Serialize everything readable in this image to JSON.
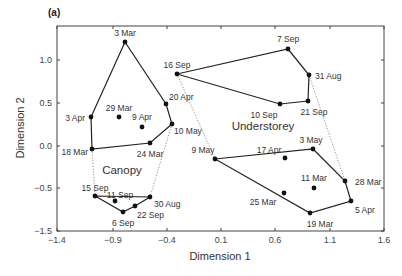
{
  "panel_label": "(a)",
  "chart_data": {
    "type": "scatter",
    "title": "",
    "panel_label": "(a)",
    "xlabel": "Dimension 1",
    "ylabel": "Dimension 2",
    "xlim": [
      -1.4,
      1.6
    ],
    "ylim": [
      -1.5,
      1.35
    ],
    "xticks": [
      "-1.4",
      "-0.9",
      "-0.4",
      "0.1",
      "0.6",
      "1.1",
      "1.6"
    ],
    "yticks": [
      "1.0",
      "0.5",
      "0.0",
      "-0.5",
      "-1.5"
    ],
    "grid": false,
    "group_labels": [
      {
        "name": "Canopy",
        "x": -0.78,
        "y": -0.38
      },
      {
        "name": "Understorey",
        "x": 0.58,
        "y": 0.27
      }
    ],
    "series": [
      {
        "name": "Canopy (spring)",
        "hull": [
          "3 Mar",
          "20 Apr",
          "10 May",
          "24 Mar",
          "18 Mar",
          "3 Apr"
        ],
        "points": [
          {
            "label": "3 Mar",
            "x": -0.78,
            "y": 0.9
          },
          {
            "label": "20 Apr",
            "x": -0.4,
            "y": 0.48
          },
          {
            "label": "10 May",
            "x": -0.34,
            "y": 0.25
          },
          {
            "label": "24 Mar",
            "x": -0.54,
            "y": 0.03
          },
          {
            "label": "18 Mar",
            "x": -1.07,
            "y": -0.03
          },
          {
            "label": "3 Apr",
            "x": -1.08,
            "y": 0.34
          },
          {
            "label": "29 Mar",
            "x": -0.82,
            "y": 0.34
          },
          {
            "label": "9 Apr",
            "x": -0.61,
            "y": 0.22
          }
        ]
      },
      {
        "name": "Canopy (late summer)",
        "hull": [
          "15 Sep",
          "30 Aug",
          "22 Sep",
          "6 Sep"
        ],
        "points": [
          {
            "label": "15 Sep",
            "x": -1.04,
            "y": -0.6
          },
          {
            "label": "30 Aug",
            "x": -0.54,
            "y": -0.61
          },
          {
            "label": "22 Sep",
            "x": -0.68,
            "y": -0.71
          },
          {
            "label": "6 Sep",
            "x": -0.79,
            "y": -0.78
          },
          {
            "label": "11 Sep",
            "x": -0.86,
            "y": -0.66
          }
        ]
      },
      {
        "name": "Understorey (late summer)",
        "hull": [
          "16 Sep",
          "7 Sep",
          "31 Aug",
          "21 Sep",
          "10 Sep"
        ],
        "points": [
          {
            "label": "16 Sep",
            "x": -0.3,
            "y": 0.84
          },
          {
            "label": "7 Sep",
            "x": 0.72,
            "y": 1.13
          },
          {
            "label": "31 Aug",
            "x": 0.91,
            "y": 0.83
          },
          {
            "label": "21 Sep",
            "x": 0.9,
            "y": 0.52
          },
          {
            "label": "10 Sep",
            "x": 0.65,
            "y": 0.49
          }
        ]
      },
      {
        "name": "Understorey (spring)",
        "hull": [
          "9 May",
          "3 May",
          "28 Mar",
          "5 Apr",
          "19 Mar"
        ],
        "points": [
          {
            "label": "9 May",
            "x": 0.04,
            "y": -0.15
          },
          {
            "label": "3 May",
            "x": 0.94,
            "y": -0.03
          },
          {
            "label": "28 Mar",
            "x": 1.23,
            "y": -0.41
          },
          {
            "label": "5 Apr",
            "x": 1.29,
            "y": -0.65
          },
          {
            "label": "19 Mar",
            "x": 0.91,
            "y": -0.79
          },
          {
            "label": "17 Apr",
            "x": 0.68,
            "y": -0.14
          },
          {
            "label": "11 Mar",
            "x": 0.95,
            "y": -0.49
          },
          {
            "label": "25 Mar",
            "x": 0.67,
            "y": -0.55
          }
        ]
      }
    ],
    "dotted_links": [
      [
        "18 Mar",
        "15 Sep"
      ],
      [
        "10 May",
        "30 Aug"
      ],
      [
        "16 Sep",
        "9 May"
      ],
      [
        "31 Aug",
        "28 Mar"
      ]
    ]
  },
  "render": {
    "frame": {
      "left": 57,
      "top": 26,
      "right": 384,
      "bottom": 231
    },
    "xticks_px": [
      57,
      113,
      167,
      221,
      275,
      330,
      384
    ],
    "yticks_px": [
      60,
      103,
      146,
      188,
      231
    ],
    "points_px": {
      "3 Mar": [
        125,
        42,
        "above",
        0,
        -6
      ],
      "20 Apr": [
        166,
        104,
        "right",
        3,
        -4
      ],
      "10 May": [
        172,
        124,
        "right",
        2,
        10
      ],
      "24 Mar": [
        150,
        143,
        "below",
        0,
        14
      ],
      "18 Mar": [
        92,
        149,
        "left",
        -4,
        6
      ],
      "3 Apr": [
        91,
        117,
        "left",
        -6,
        4
      ],
      "29 Mar": [
        119,
        117,
        "above",
        0,
        -6
      ],
      "9 Apr": [
        142,
        127,
        "above",
        0,
        -7
      ],
      "15 Sep": [
        95,
        196,
        "above",
        0,
        -5
      ],
      "30 Aug": [
        150,
        197,
        "right",
        4,
        10
      ],
      "22 Sep": [
        135,
        206,
        "right",
        2,
        12
      ],
      "6 Sep": [
        123,
        212,
        "below",
        0,
        14
      ],
      "11 Sep": [
        115,
        201,
        "above",
        5,
        -3
      ],
      "16 Sep": [
        177,
        74,
        "above",
        0,
        -6
      ],
      "7 Sep": [
        288,
        49,
        "above",
        0,
        -7
      ],
      "31 Aug": [
        309,
        75,
        "right",
        6,
        4
      ],
      "21 Sep": [
        308,
        101,
        "below",
        6,
        14
      ],
      "10 Sep": [
        280,
        104,
        "below",
        -16,
        14
      ],
      "9 May": [
        215,
        159,
        "above",
        -12,
        -6
      ],
      "3 May": [
        313,
        149,
        "above",
        -2,
        -6
      ],
      "28 Mar": [
        345,
        181,
        "right",
        10,
        4
      ],
      "5 Apr": [
        351,
        201,
        "right",
        4,
        12
      ],
      "19 Mar": [
        310,
        213,
        "below",
        10,
        14
      ],
      "17 Apr": [
        285,
        158,
        "above",
        -16,
        -5
      ],
      "11 Mar": [
        314,
        188,
        "above",
        0,
        -7
      ],
      "25 Mar": [
        284,
        193,
        "below",
        -21,
        12
      ]
    },
    "group_labels_px": {
      "Canopy": [
        122,
        174
      ],
      "Understorey": [
        263,
        130
      ]
    }
  }
}
